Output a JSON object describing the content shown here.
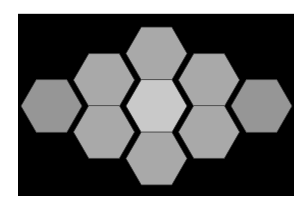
{
  "figure": {
    "background": "#000000",
    "page_background": "#ffffff",
    "hex_orientation": "flat-top",
    "hex_radius": 30.5,
    "outline_color": "#3a3a3a",
    "colors": {
      "center": "#c9c9c9",
      "ring": "#a9a9a9",
      "outer": "#969696"
    },
    "hexagons": [
      {
        "id": "top",
        "cx": 156.5,
        "cy": 53.5,
        "tone": "ring"
      },
      {
        "id": "upper-left",
        "cx": 104,
        "cy": 80,
        "tone": "ring"
      },
      {
        "id": "upper-right",
        "cx": 209,
        "cy": 80,
        "tone": "ring"
      },
      {
        "id": "far-left",
        "cx": 51.5,
        "cy": 106,
        "tone": "outer"
      },
      {
        "id": "center",
        "cx": 156.5,
        "cy": 106,
        "tone": "center"
      },
      {
        "id": "far-right",
        "cx": 261.5,
        "cy": 106,
        "tone": "outer"
      },
      {
        "id": "lower-left",
        "cx": 104,
        "cy": 132,
        "tone": "ring"
      },
      {
        "id": "lower-right",
        "cx": 209,
        "cy": 132,
        "tone": "ring"
      },
      {
        "id": "bottom",
        "cx": 156.5,
        "cy": 158.5,
        "tone": "ring"
      }
    ]
  }
}
